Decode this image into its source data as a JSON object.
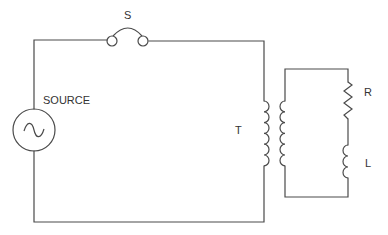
{
  "diagram": {
    "type": "circuit-schematic",
    "labels": {
      "switch": "S",
      "source": "SOURCE",
      "transformer": "T",
      "resistor": "R",
      "inductor": "L"
    },
    "components": [
      {
        "id": "source",
        "kind": "ac-voltage-source",
        "label": "SOURCE"
      },
      {
        "id": "switch",
        "kind": "switch",
        "label": "S"
      },
      {
        "id": "transformer",
        "kind": "transformer",
        "label": "T"
      },
      {
        "id": "resistor",
        "kind": "resistor",
        "label": "R"
      },
      {
        "id": "inductor",
        "kind": "inductor",
        "label": "L"
      }
    ],
    "circuits": [
      {
        "name": "primary",
        "elements": [
          "source",
          "switch",
          "transformer-primary"
        ]
      },
      {
        "name": "secondary",
        "elements": [
          "transformer-secondary",
          "resistor",
          "inductor"
        ]
      }
    ]
  }
}
